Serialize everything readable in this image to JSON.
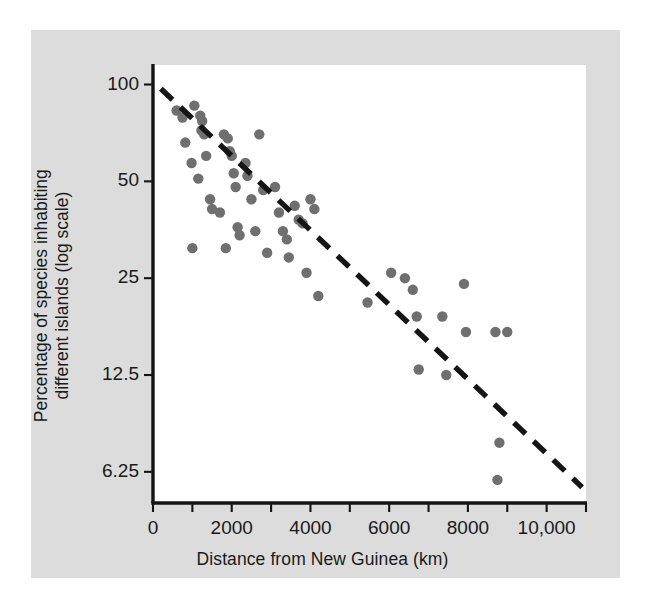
{
  "chart_data": {
    "type": "scatter",
    "title": "",
    "xlabel": "Distance from New Guinea (km)",
    "ylabel": "Percentage of species inhabiting different islands (log scale)",
    "ylabel_line1": "Percentage of species inhabiting",
    "ylabel_line2": "different islands (log scale)",
    "yscale": "log",
    "xlim": [
      0,
      11000
    ],
    "ylim": [
      5.0,
      115
    ],
    "grid": "vertical-only",
    "gridline_interval": 1000,
    "legend": "none",
    "xticks": [
      0,
      2000,
      4000,
      6000,
      8000,
      10000
    ],
    "xticklabels": [
      "0",
      "2000",
      "4000",
      "6000",
      "8000",
      "10,000"
    ],
    "xminor_ticks": [
      1000,
      3000,
      5000,
      7000,
      9000,
      11000
    ],
    "yticks": [
      100,
      50,
      25,
      12.5,
      6.25
    ],
    "yticklabels": [
      "100",
      "50",
      "25",
      "12.5",
      "6.25"
    ],
    "point_color": "#6f6f6f",
    "line_color": "#151515",
    "axis_color": "#141414",
    "gridline_color": "#c9c9c9",
    "plot_background": "#ffffff",
    "figure_background": "#dcdcdc",
    "trendline": {
      "style": "dashed",
      "x": [
        200,
        10900
      ],
      "y": [
        97,
        5.6
      ]
    },
    "points": [
      {
        "x": 600,
        "y": 83
      },
      {
        "x": 750,
        "y": 79
      },
      {
        "x": 820,
        "y": 66
      },
      {
        "x": 1050,
        "y": 86
      },
      {
        "x": 1200,
        "y": 80
      },
      {
        "x": 1230,
        "y": 72
      },
      {
        "x": 1250,
        "y": 77
      },
      {
        "x": 1300,
        "y": 70
      },
      {
        "x": 980,
        "y": 57
      },
      {
        "x": 1150,
        "y": 51
      },
      {
        "x": 1350,
        "y": 60
      },
      {
        "x": 1000,
        "y": 31
      },
      {
        "x": 1450,
        "y": 44
      },
      {
        "x": 1500,
        "y": 41
      },
      {
        "x": 1700,
        "y": 40
      },
      {
        "x": 1800,
        "y": 70
      },
      {
        "x": 1900,
        "y": 68
      },
      {
        "x": 1950,
        "y": 62
      },
      {
        "x": 2000,
        "y": 60
      },
      {
        "x": 2050,
        "y": 53
      },
      {
        "x": 2100,
        "y": 48
      },
      {
        "x": 1850,
        "y": 31
      },
      {
        "x": 2150,
        "y": 36
      },
      {
        "x": 2200,
        "y": 34
      },
      {
        "x": 2350,
        "y": 57
      },
      {
        "x": 2400,
        "y": 52
      },
      {
        "x": 2500,
        "y": 44
      },
      {
        "x": 2600,
        "y": 35
      },
      {
        "x": 2700,
        "y": 70
      },
      {
        "x": 2800,
        "y": 47
      },
      {
        "x": 2900,
        "y": 30
      },
      {
        "x": 3100,
        "y": 48
      },
      {
        "x": 3200,
        "y": 40
      },
      {
        "x": 3300,
        "y": 35
      },
      {
        "x": 3400,
        "y": 33
      },
      {
        "x": 3450,
        "y": 29
      },
      {
        "x": 3600,
        "y": 42
      },
      {
        "x": 3700,
        "y": 38
      },
      {
        "x": 3800,
        "y": 37
      },
      {
        "x": 3900,
        "y": 26
      },
      {
        "x": 4000,
        "y": 44
      },
      {
        "x": 4100,
        "y": 41
      },
      {
        "x": 4200,
        "y": 22
      },
      {
        "x": 5450,
        "y": 21
      },
      {
        "x": 6050,
        "y": 26
      },
      {
        "x": 6400,
        "y": 25
      },
      {
        "x": 6600,
        "y": 23
      },
      {
        "x": 6700,
        "y": 19
      },
      {
        "x": 6750,
        "y": 13
      },
      {
        "x": 7350,
        "y": 19
      },
      {
        "x": 7450,
        "y": 12.5
      },
      {
        "x": 7900,
        "y": 24
      },
      {
        "x": 7950,
        "y": 17
      },
      {
        "x": 8700,
        "y": 17
      },
      {
        "x": 8750,
        "y": 5.9
      },
      {
        "x": 8800,
        "y": 7.7
      },
      {
        "x": 9000,
        "y": 17
      }
    ]
  }
}
